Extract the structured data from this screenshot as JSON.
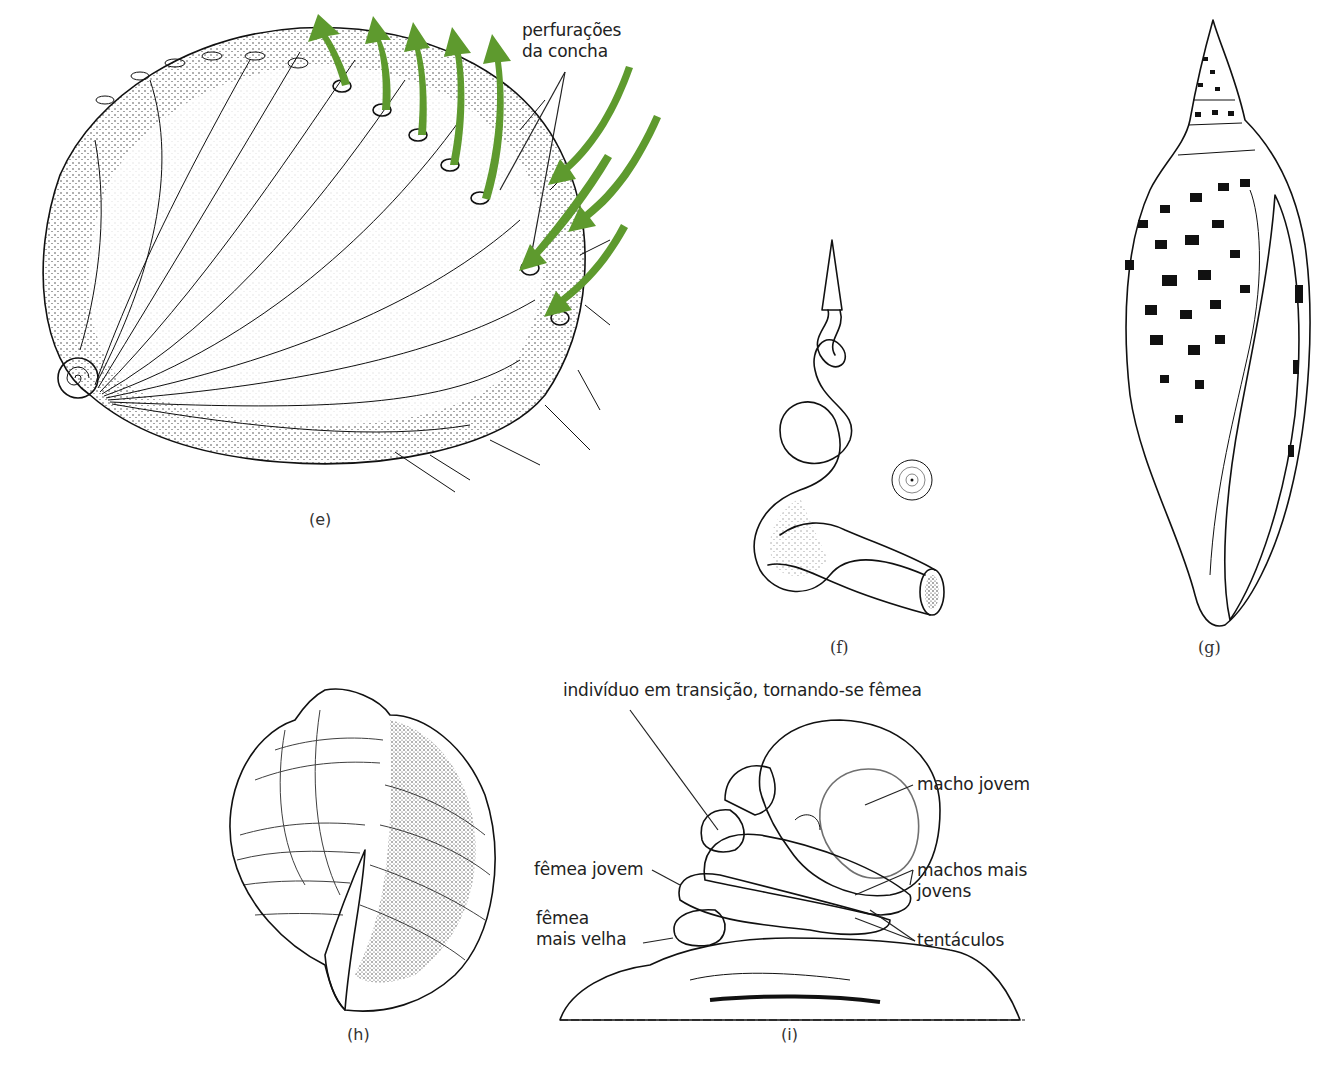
{
  "figure": {
    "background": "#ffffff",
    "ink_color": "#111111",
    "arrow_color": "#5e9a2e",
    "panels": [
      {
        "id": "e",
        "caption": "(e)",
        "subject": "abalone-shell",
        "labels": [
          {
            "text_line1": "perfurações",
            "text_line2": "da concha"
          }
        ],
        "arrows": {
          "outflow_count": 5,
          "inflow_count": 4
        }
      },
      {
        "id": "f",
        "caption": "(f)",
        "subject": "uncoiled-worm-snail-shell"
      },
      {
        "id": "g",
        "caption": "(g)",
        "subject": "spotted-volute-shell"
      },
      {
        "id": "h",
        "caption": "(h)",
        "subject": "tun-shell"
      },
      {
        "id": "i",
        "caption": "(i)",
        "subject": "slipper-limpet-stack",
        "labels": {
          "transition": "indivíduo em transição, tornando-se fêmea",
          "young_male": "macho jovem",
          "younger_males_line1": "machos mais",
          "younger_males_line2": "jovens",
          "young_female": "fêmea jovem",
          "older_female_line1": "fêmea",
          "older_female_line2": "mais velha",
          "tentacles": "tentáculos"
        }
      }
    ]
  }
}
